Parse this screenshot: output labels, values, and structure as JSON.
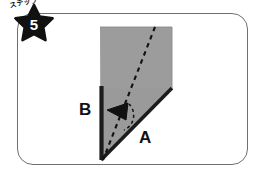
{
  "panel": {
    "shape": "rounded-rectangle",
    "border_color": "#6f6f6f",
    "background_color": "#ffffff"
  },
  "step_badge": {
    "kicker": "ステップ",
    "number": "5",
    "star_color": "#111111",
    "number_color": "#ffffff"
  },
  "illustration": {
    "description": "origami fold diagram",
    "paper_fill": "#9a9a9a",
    "edge_color": "#1c1c1c",
    "fold_line_style": "dashed",
    "labels": {
      "left_edge": "B",
      "bottom_edge": "A"
    },
    "arrow": {
      "direction": "left",
      "color": "#111111"
    }
  }
}
